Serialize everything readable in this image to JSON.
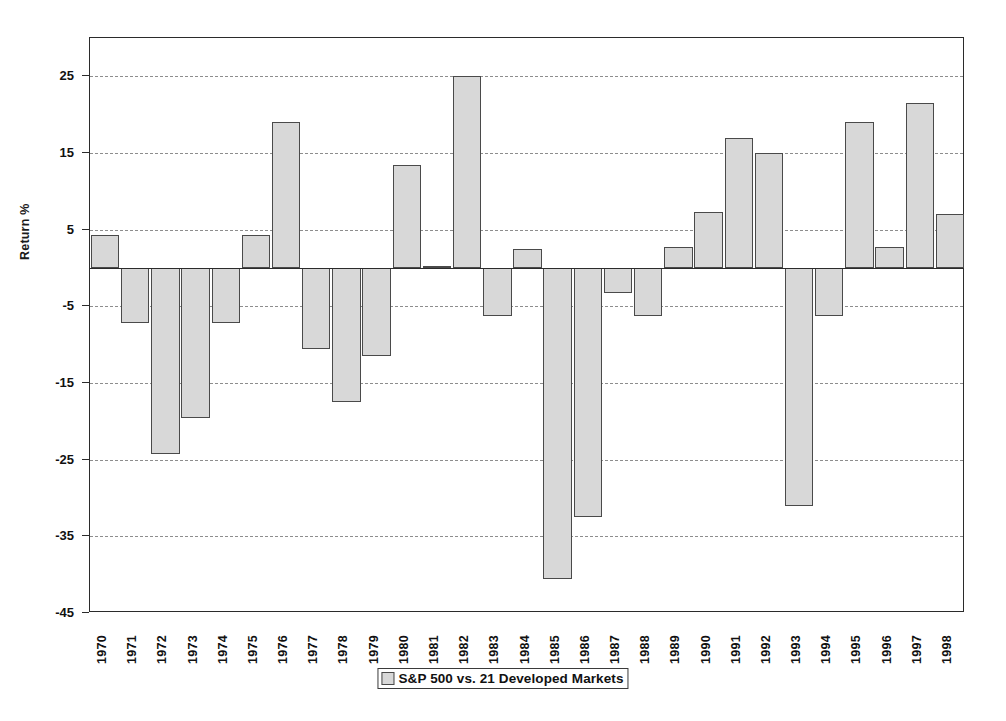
{
  "chart_data": {
    "type": "bar",
    "title": "",
    "xlabel": "",
    "ylabel": "Return %",
    "ylim": [
      -45,
      30
    ],
    "yticks": [
      25,
      15,
      5,
      -5,
      -15,
      -25,
      -35,
      -45
    ],
    "grid": true,
    "legend_position": "bottom",
    "legend": [
      "S&P 500 vs. 21 Developed Markets"
    ],
    "categories": [
      "1970",
      "1971",
      "1972",
      "1973",
      "1974",
      "1975",
      "1976",
      "1977",
      "1978",
      "1979",
      "1980",
      "1981",
      "1982",
      "1983",
      "1984",
      "1985",
      "1986",
      "1987",
      "1988",
      "1989",
      "1990",
      "1991",
      "1992",
      "1993",
      "1994",
      "1995",
      "1996",
      "1997",
      "1998"
    ],
    "values": [
      4.3,
      -7.2,
      -24.2,
      -19.5,
      -7.2,
      4.3,
      19.0,
      -10.5,
      -17.5,
      -11.5,
      13.5,
      0.3,
      25.0,
      -6.2,
      2.5,
      -40.5,
      -32.5,
      -3.3,
      -6.3,
      2.8,
      7.3,
      17.0,
      15.0,
      -31.0,
      -6.3,
      19.0,
      2.8,
      21.5,
      7.0
    ],
    "series": [
      {
        "name": "S&P 500 vs. 21 Developed Markets",
        "values": [
          4.3,
          -7.2,
          -24.2,
          -19.5,
          -7.2,
          4.3,
          19.0,
          -10.5,
          -17.5,
          -11.5,
          13.5,
          0.3,
          25.0,
          -6.2,
          2.5,
          -40.5,
          -32.5,
          -3.3,
          -6.3,
          2.8,
          7.3,
          17.0,
          15.0,
          -31.0,
          -6.3,
          19.0,
          2.8,
          21.5,
          7.0
        ]
      }
    ],
    "bar_color": "#d8d8d8",
    "bar_edge_color": "#4a4a4a",
    "grid_color": "#8d8d8d",
    "axis_color": "#2b2b2b"
  },
  "legend": {
    "label": "S&P 500 vs. 21 Developed Markets"
  },
  "axes": {
    "y_title": "Return %"
  }
}
